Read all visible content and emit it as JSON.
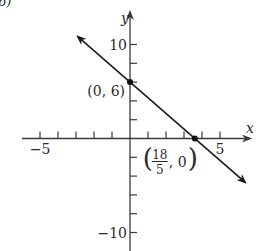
{
  "panel_label": "b)",
  "chart_data": {
    "type": "line",
    "title": "",
    "xlabel": "x",
    "ylabel": "y",
    "xlim": [
      -5.5,
      7
    ],
    "ylim": [
      -11,
      11.5
    ],
    "x_ticks": [
      -5,
      -4,
      -3,
      -2,
      -1,
      1,
      2,
      3,
      4,
      5
    ],
    "y_ticks": [
      -10,
      -8,
      -6,
      -4,
      -2,
      2,
      4,
      6,
      8,
      10
    ],
    "x_tick_labels": [
      {
        "value": -5,
        "text": "−5"
      },
      {
        "value": 5,
        "text": "5"
      }
    ],
    "y_tick_labels": [
      {
        "value": 10,
        "text": "10"
      },
      {
        "value": -10,
        "text": "−10"
      }
    ],
    "grid": false,
    "series": [
      {
        "name": "line",
        "equation": "y = -5/3 x + 6",
        "slope": -1.6667,
        "intercept": 6,
        "x_range": [
          -2.9,
          6.4
        ],
        "arrows": "both",
        "color": "#1a1a1a"
      }
    ],
    "points": [
      {
        "x": 0,
        "y": 6,
        "label": "(0, 6)"
      },
      {
        "x": 3.6,
        "y": 0,
        "label_num": "18",
        "label_den": "5",
        "label_tail": ", 0)",
        "label_head": "("
      }
    ],
    "axis_color": "#3a3a3a"
  }
}
